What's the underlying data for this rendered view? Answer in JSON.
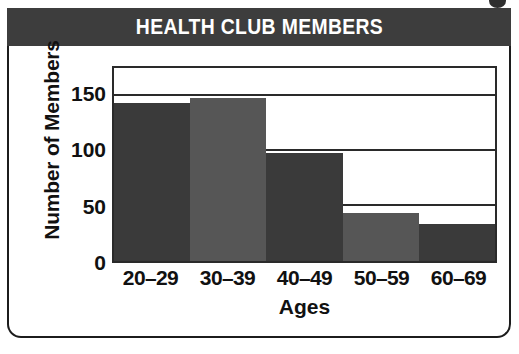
{
  "chart_data": {
    "type": "bar",
    "title": "HEALTH CLUB MEMBERS",
    "xlabel": "Ages",
    "ylabel": "Number of Members",
    "categories": [
      "20–29",
      "30–39",
      "40–49",
      "50–59",
      "60–69"
    ],
    "values": [
      145,
      150,
      100,
      45,
      35
    ],
    "ylim": [
      0,
      175
    ],
    "yticks": [
      0,
      50,
      100,
      150
    ],
    "ytick_labels": [
      "0",
      "50",
      "100",
      "150"
    ],
    "grid": true,
    "legend": false,
    "bar_colors": [
      "#3a3a3a",
      "#565656",
      "#3a3a3a",
      "#565656",
      "#3a3a3a"
    ]
  },
  "style": {
    "title_bar_color": "#3d3d3d",
    "title_text_color": "#ffffff",
    "axis_color": "#2a2a2a",
    "card_border_color": "#1c1c1c",
    "background": "#ffffff"
  }
}
